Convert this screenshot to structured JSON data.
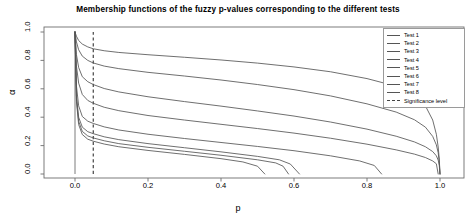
{
  "chart_data": {
    "type": "line",
    "title": "Membership functions of the fuzzy p-values corresponding to the different tests",
    "xlabel": "p",
    "ylabel": "α",
    "xlim": [
      0.0,
      1.0
    ],
    "ylim": [
      0.0,
      1.0
    ],
    "xticks": [
      "0.0",
      "0.2",
      "0.4",
      "0.6",
      "0.8",
      "1.0"
    ],
    "xtick_values": [
      0.0,
      0.2,
      0.4,
      0.6,
      0.8,
      1.0
    ],
    "yticks": [
      "0.0",
      "0.2",
      "0.4",
      "0.6",
      "0.8",
      "1.0"
    ],
    "ytick_values": [
      0.0,
      0.2,
      0.4,
      0.6,
      0.8,
      1.0
    ],
    "grid": false,
    "legend_position": "top-right",
    "line_color": "#555555",
    "significance_color": "#333333",
    "significance_level": 0.05,
    "series": [
      {
        "name": "Test 1",
        "alpha_at_significance": 0.88,
        "x_end": 1.0,
        "points": [
          [
            0.0,
            1.0
          ],
          [
            0.004,
            0.97
          ],
          [
            0.01,
            0.94
          ],
          [
            0.02,
            0.915
          ],
          [
            0.035,
            0.895
          ],
          [
            0.05,
            0.882
          ],
          [
            0.08,
            0.868
          ],
          [
            0.12,
            0.856
          ],
          [
            0.2,
            0.84
          ],
          [
            0.3,
            0.822
          ],
          [
            0.4,
            0.803
          ],
          [
            0.5,
            0.781
          ],
          [
            0.6,
            0.754
          ],
          [
            0.7,
            0.72
          ],
          [
            0.8,
            0.672
          ],
          [
            0.88,
            0.618
          ],
          [
            0.93,
            0.555
          ],
          [
            0.96,
            0.48
          ],
          [
            0.98,
            0.38
          ],
          [
            0.99,
            0.28
          ],
          [
            0.995,
            0.19
          ],
          [
            0.998,
            0.105
          ],
          [
            1.0,
            0.0
          ]
        ]
      },
      {
        "name": "Test 2",
        "alpha_at_significance": 0.78,
        "x_end": 1.0,
        "points": [
          [
            0.0,
            1.0
          ],
          [
            0.004,
            0.93
          ],
          [
            0.01,
            0.875
          ],
          [
            0.02,
            0.83
          ],
          [
            0.035,
            0.8
          ],
          [
            0.05,
            0.782
          ],
          [
            0.08,
            0.76
          ],
          [
            0.12,
            0.742
          ],
          [
            0.2,
            0.716
          ],
          [
            0.3,
            0.69
          ],
          [
            0.4,
            0.662
          ],
          [
            0.5,
            0.63
          ],
          [
            0.6,
            0.594
          ],
          [
            0.7,
            0.55
          ],
          [
            0.8,
            0.494
          ],
          [
            0.88,
            0.436
          ],
          [
            0.93,
            0.382
          ],
          [
            0.96,
            0.33
          ],
          [
            0.98,
            0.265
          ],
          [
            0.99,
            0.205
          ],
          [
            0.995,
            0.15
          ],
          [
            0.998,
            0.085
          ],
          [
            1.0,
            0.0
          ]
        ]
      },
      {
        "name": "Test 3",
        "alpha_at_significance": 0.63,
        "x_end": 1.0,
        "points": [
          [
            0.0,
            1.0
          ],
          [
            0.004,
            0.84
          ],
          [
            0.01,
            0.75
          ],
          [
            0.02,
            0.685
          ],
          [
            0.035,
            0.65
          ],
          [
            0.05,
            0.63
          ],
          [
            0.08,
            0.602
          ],
          [
            0.12,
            0.578
          ],
          [
            0.2,
            0.544
          ],
          [
            0.3,
            0.51
          ],
          [
            0.4,
            0.478
          ],
          [
            0.5,
            0.444
          ],
          [
            0.6,
            0.408
          ],
          [
            0.7,
            0.366
          ],
          [
            0.8,
            0.316
          ],
          [
            0.88,
            0.266
          ],
          [
            0.93,
            0.226
          ],
          [
            0.96,
            0.192
          ],
          [
            0.98,
            0.158
          ],
          [
            0.99,
            0.128
          ],
          [
            0.995,
            0.098
          ],
          [
            0.998,
            0.06
          ],
          [
            1.0,
            0.0
          ]
        ]
      },
      {
        "name": "Test 4",
        "alpha_at_significance": 0.5,
        "x_end": 0.995,
        "points": [
          [
            0.0,
            1.0
          ],
          [
            0.004,
            0.76
          ],
          [
            0.01,
            0.64
          ],
          [
            0.02,
            0.56
          ],
          [
            0.035,
            0.518
          ],
          [
            0.05,
            0.498
          ],
          [
            0.08,
            0.47
          ],
          [
            0.12,
            0.446
          ],
          [
            0.2,
            0.412
          ],
          [
            0.3,
            0.38
          ],
          [
            0.4,
            0.35
          ],
          [
            0.5,
            0.32
          ],
          [
            0.6,
            0.288
          ],
          [
            0.7,
            0.252
          ],
          [
            0.8,
            0.21
          ],
          [
            0.88,
            0.17
          ],
          [
            0.93,
            0.14
          ],
          [
            0.96,
            0.116
          ],
          [
            0.98,
            0.092
          ],
          [
            0.99,
            0.072
          ],
          [
            0.995,
            0.0
          ]
        ]
      },
      {
        "name": "Test 5",
        "alpha_at_significance": 0.36,
        "x_end": 0.84,
        "points": [
          [
            0.0,
            1.0
          ],
          [
            0.004,
            0.62
          ],
          [
            0.01,
            0.48
          ],
          [
            0.02,
            0.405
          ],
          [
            0.035,
            0.372
          ],
          [
            0.05,
            0.356
          ],
          [
            0.08,
            0.332
          ],
          [
            0.12,
            0.31
          ],
          [
            0.2,
            0.28
          ],
          [
            0.3,
            0.25
          ],
          [
            0.4,
            0.222
          ],
          [
            0.5,
            0.194
          ],
          [
            0.6,
            0.164
          ],
          [
            0.7,
            0.128
          ],
          [
            0.78,
            0.092
          ],
          [
            0.82,
            0.06
          ],
          [
            0.84,
            0.0
          ]
        ]
      },
      {
        "name": "Test 6",
        "alpha_at_significance": 0.285,
        "x_end": 0.615,
        "points": [
          [
            0.0,
            1.0
          ],
          [
            0.004,
            0.55
          ],
          [
            0.01,
            0.4
          ],
          [
            0.02,
            0.33
          ],
          [
            0.035,
            0.298
          ],
          [
            0.05,
            0.284
          ],
          [
            0.08,
            0.262
          ],
          [
            0.12,
            0.242
          ],
          [
            0.2,
            0.214
          ],
          [
            0.3,
            0.185
          ],
          [
            0.4,
            0.156
          ],
          [
            0.5,
            0.124
          ],
          [
            0.56,
            0.1
          ],
          [
            0.59,
            0.07
          ],
          [
            0.615,
            0.0
          ]
        ]
      },
      {
        "name": "Test 7",
        "alpha_at_significance": 0.255,
        "x_end": 0.585,
        "points": [
          [
            0.0,
            1.0
          ],
          [
            0.004,
            0.53
          ],
          [
            0.01,
            0.372
          ],
          [
            0.02,
            0.3
          ],
          [
            0.035,
            0.268
          ],
          [
            0.05,
            0.254
          ],
          [
            0.08,
            0.234
          ],
          [
            0.12,
            0.214
          ],
          [
            0.2,
            0.188
          ],
          [
            0.3,
            0.16
          ],
          [
            0.4,
            0.132
          ],
          [
            0.5,
            0.1
          ],
          [
            0.55,
            0.078
          ],
          [
            0.57,
            0.055
          ],
          [
            0.585,
            0.0
          ]
        ]
      },
      {
        "name": "Test 8",
        "alpha_at_significance": 0.232,
        "x_end": 0.52,
        "points": [
          [
            0.0,
            1.0
          ],
          [
            0.004,
            0.51
          ],
          [
            0.01,
            0.348
          ],
          [
            0.02,
            0.278
          ],
          [
            0.035,
            0.245
          ],
          [
            0.05,
            0.231
          ],
          [
            0.08,
            0.211
          ],
          [
            0.12,
            0.192
          ],
          [
            0.2,
            0.166
          ],
          [
            0.3,
            0.138
          ],
          [
            0.4,
            0.108
          ],
          [
            0.46,
            0.085
          ],
          [
            0.5,
            0.055
          ],
          [
            0.52,
            0.0
          ]
        ]
      }
    ],
    "vertical_lines": [
      {
        "name": "p-axis-line",
        "x": 0.0,
        "style": "solid"
      },
      {
        "name": "significance-line",
        "x": 0.05,
        "style": "dashed"
      }
    ]
  },
  "legend": {
    "items": [
      {
        "label": "Test 1",
        "style": "solid"
      },
      {
        "label": "Test 2",
        "style": "solid"
      },
      {
        "label": "Test 3",
        "style": "solid"
      },
      {
        "label": "Test 4",
        "style": "solid"
      },
      {
        "label": "Test 5",
        "style": "solid"
      },
      {
        "label": "Test 6",
        "style": "solid"
      },
      {
        "label": "Test 7",
        "style": "solid"
      },
      {
        "label": "Test 8",
        "style": "solid"
      },
      {
        "label": "Significance level",
        "style": "dashed"
      }
    ]
  }
}
